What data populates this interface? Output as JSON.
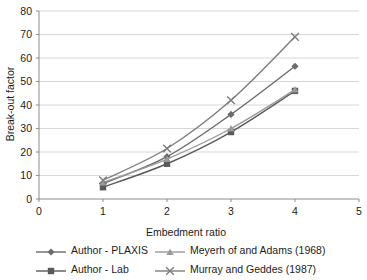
{
  "chart_data": {
    "type": "line",
    "title": "",
    "xlabel": "Embedment ratio",
    "ylabel": "Break-out factor",
    "x": [
      1,
      2,
      3,
      4
    ],
    "xlim": [
      0,
      5
    ],
    "ylim": [
      0,
      80
    ],
    "xticks": [
      "0",
      "1",
      "2",
      "3",
      "4",
      "5"
    ],
    "yticks": [
      "0",
      "10",
      "20",
      "30",
      "40",
      "50",
      "60",
      "70",
      "80"
    ],
    "grid": "horizontal",
    "legend_position": "bottom",
    "series": [
      {
        "name": "Author - PLAXIS",
        "marker": "diamond",
        "color": "#6b6b6b",
        "values": [
          6.5,
          18,
          36,
          56.5
        ]
      },
      {
        "name": "Author - Lab",
        "marker": "square",
        "color": "#5a5a5a",
        "values": [
          5,
          15,
          28.5,
          46
        ]
      },
      {
        "name": "Meyerh of and Adams (1968)",
        "marker": "triangle",
        "color": "#9a9a9a",
        "values": [
          7,
          17,
          30,
          46.5
        ]
      },
      {
        "name": "Murray and Geddes (1987)",
        "marker": "cross",
        "color": "#7d7d7d",
        "values": [
          8,
          21.5,
          42,
          69
        ]
      }
    ]
  },
  "axes": {
    "x_title": "Embedment ratio",
    "y_title": "Break-out factor",
    "x_tick_labels": [
      "0",
      "1",
      "2",
      "3",
      "4",
      "5"
    ],
    "y_tick_labels": [
      "0",
      "10",
      "20",
      "30",
      "40",
      "50",
      "60",
      "70",
      "80"
    ]
  },
  "legend": {
    "entries": [
      {
        "label": "Author - PLAXIS",
        "marker": "diamond"
      },
      {
        "label": "Author - Lab",
        "marker": "square"
      },
      {
        "label": "Meyerh of and Adams (1968)",
        "marker": "triangle"
      },
      {
        "label": "Murray and Geddes (1987)",
        "marker": "cross"
      }
    ]
  },
  "colors": {
    "grid": "#d7d7d7",
    "axis": "#8c8c8c",
    "text": "#1c1c1c",
    "background": "#ffffff"
  }
}
